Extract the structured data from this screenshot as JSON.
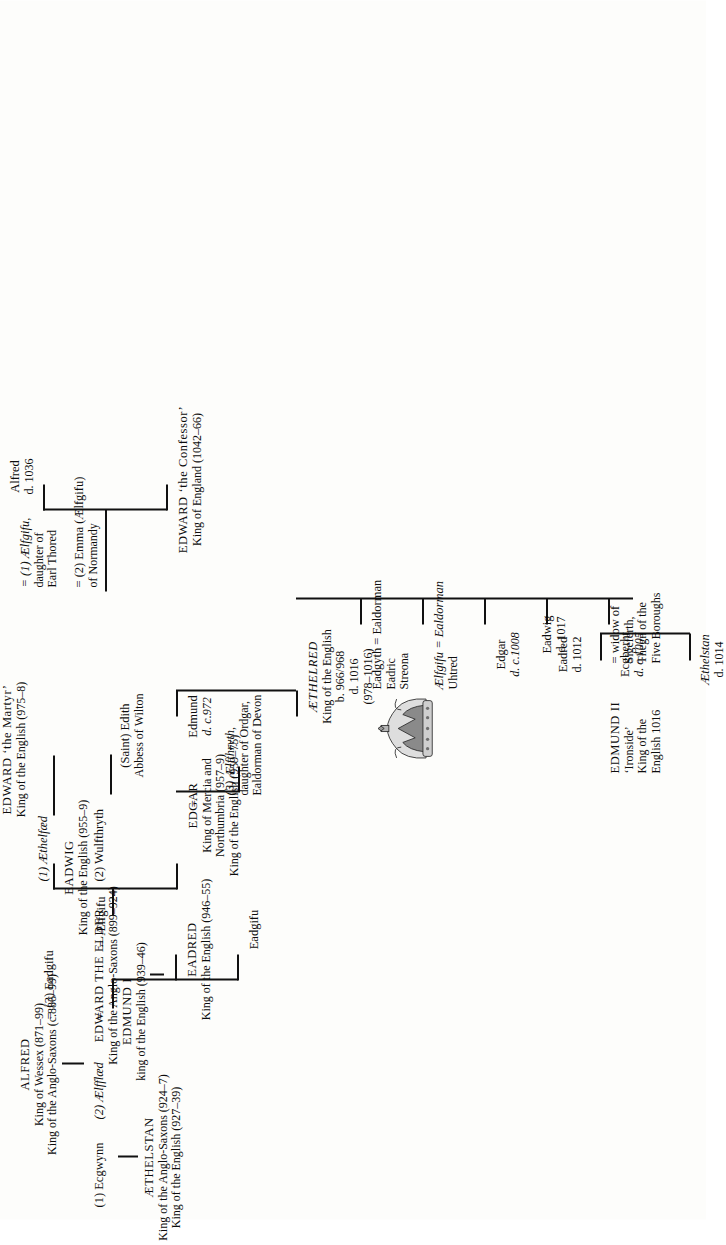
{
  "document": {
    "type": "genealogical-family-tree",
    "title": "The House of Wessex: Alfred to Edward the Confessor",
    "orientation": "rotated-90-ccw"
  },
  "people": {
    "alfred": {
      "name": "ALFRED",
      "line1": "King of Wessex (871–99)",
      "line2": "King of the Anglo-Saxons (c.886–99)"
    },
    "edward_elder": {
      "name": "EDWARD THE ELDER",
      "line1": "King of the Anglo-Saxons (899–924)"
    },
    "ecgwynn": {
      "name": "(1) Ecgwynn"
    },
    "aelfflaed": {
      "name": "(2) Ælfflæd"
    },
    "eadgifu_wife": {
      "name": "(3) Eadgifu"
    },
    "aethelstan": {
      "name": "ÆTHELSTAN",
      "line1": "King of the Anglo-Saxons (924–7)",
      "line2": "King of the English (927–39)"
    },
    "edmund_i": {
      "name": "EDMUND I",
      "line1": "king of the English (939–46)"
    },
    "aelfgifu_wife": {
      "name": "Ælfgifu"
    },
    "eadred": {
      "name": "EADRED",
      "line1": "King of the English (946–55)"
    },
    "eadgifu_daughter": {
      "name": "Eadgifu"
    },
    "eadwig": {
      "name": "EADWIG",
      "line1": "King of the English (955–9)"
    },
    "edgar": {
      "name": "EDGAR",
      "line1": "King of Mercia and",
      "line2": "Northumbria (957–9)",
      "line3": "King of the English (959–75)"
    },
    "aethelflaed": {
      "name": "(1) Æthelfæd"
    },
    "wulfthryth": {
      "name": "(2) Wulfthryth"
    },
    "aelfthryth": {
      "name": "(3) Ælfthryth,",
      "line1": "daughter of Ordgar,",
      "line2": "Ealdorman of Devon"
    },
    "edward_martyr": {
      "name": "EDWARD ‘the Martyr’",
      "line1": "King of the English (975–8)"
    },
    "saint_edith": {
      "name": "(Saint) Edith",
      "line1": "Abbess of Wilton"
    },
    "edmund_972": {
      "name": "Edmund",
      "line1": "d. c.972"
    },
    "aethelred": {
      "name": "ÆTHELRED",
      "line1": "King of the English",
      "line2": "b. 966/968",
      "line3": "d. 1016",
      "line4": "(978–1016)"
    },
    "aelfgifu_thored": {
      "name": "= (1) Ælfgifu,",
      "line1": "daughter of",
      "line2": "Earl Thored"
    },
    "emma_normandy": {
      "name": "= (2) Emma (Ælfgifu)",
      "line1": "of Normandy"
    },
    "aethelstan_1014": {
      "name": "Æthelstan",
      "line1": "d. 1014"
    },
    "ecgberht": {
      "name": "Ecgberht",
      "line1": "d. c.1005"
    },
    "edmund_ii": {
      "name": "EDMUND II",
      "line1": "‘Ironside’",
      "line2": "King of the",
      "line3": "English 1016"
    },
    "edmund_ii_wife": {
      "name": "= widow of",
      "line1": "Sigeferth,",
      "line2": "Thegn of the",
      "line3": "Five Boroughs"
    },
    "eadred_1012": {
      "name": "Eadred",
      "line1": "d. 1012"
    },
    "eadwig_1017": {
      "name": "Eadwig",
      "line1": "d. 1017"
    },
    "edgar_1008": {
      "name": "Edgar",
      "line1": "d. c.1008"
    },
    "aelfgifu_uhtred": {
      "name": "Ælfgifu = Ealdorman",
      "line1": "Uhtred"
    },
    "eadgyth_eadric": {
      "name": "Eadgyth = Ealdorman",
      "line1": "Eadric",
      "line2": "Streona"
    },
    "edward_confessor": {
      "name": "EDWARD ‘the Confessor’",
      "line1": "King of England (1042–66)"
    },
    "alfred_1036": {
      "name": "Alfred",
      "line1": "d. 1036"
    }
  },
  "symbols": {
    "marriage": "=",
    "crown_icon": "crown-icon"
  },
  "colors": {
    "ink": "#0d0d0d",
    "paper": "#fdfdfb",
    "line": "#111111"
  }
}
